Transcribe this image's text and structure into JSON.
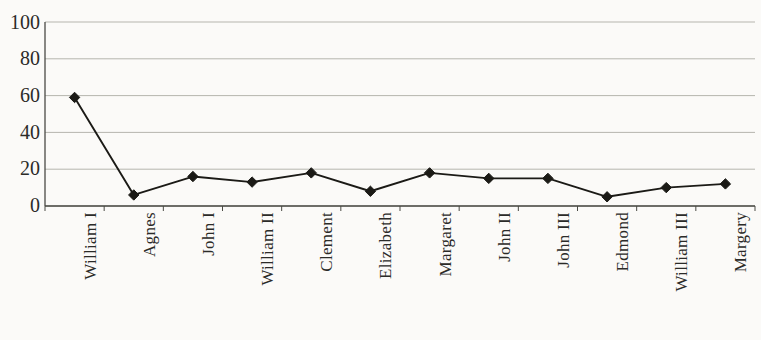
{
  "chart_data": {
    "type": "line",
    "title": "",
    "subtitle": "",
    "xlabel": "",
    "ylabel": "",
    "categories": [
      "William I",
      "Agnes",
      "John I",
      "William II",
      "Clement",
      "Elizabeth",
      "Margaret",
      "John II",
      "John III",
      "Edmond",
      "William III",
      "Margery"
    ],
    "series": [
      {
        "name": "",
        "values": [
          59,
          6,
          16,
          13,
          18,
          8,
          18,
          15,
          15,
          5,
          10,
          12
        ]
      }
    ],
    "ylim": [
      0,
      100
    ],
    "yticks": [
      0,
      20,
      40,
      60,
      80,
      100
    ],
    "ytick_labels": [
      "0",
      "20",
      "40",
      "60",
      "80",
      "100"
    ],
    "grid": true,
    "grid_axis": "y",
    "legend": false,
    "legend_position": "none",
    "marker": "diamond",
    "colors": {
      "line": "#1b1a16",
      "marker": "#1b1a16",
      "grid": "#b6b5ae",
      "axis": "#4a4a44",
      "background": "#fbfaf8",
      "text": "#2b2b28"
    }
  },
  "caption": {
    "text": "",
    "note": "cut-off caption at bottom edge"
  }
}
